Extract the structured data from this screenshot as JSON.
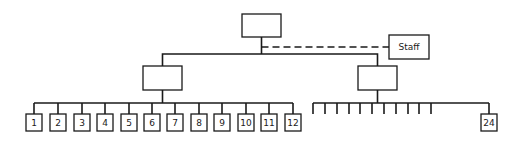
{
  "diagram": {
    "type": "org-chart",
    "top_node": {
      "label": "",
      "box": [
        242,
        14,
        39,
        23
      ]
    },
    "staff_node": {
      "label": "Staff",
      "box": [
        389,
        35,
        40,
        24
      ],
      "link": "dashed"
    },
    "mid_nodes": [
      {
        "label": "",
        "box": [
          143,
          66,
          39,
          24
        ]
      },
      {
        "label": "",
        "box": [
          358,
          66,
          39,
          24
        ]
      }
    ],
    "left_children": {
      "bar_y": 103,
      "box_y": 114,
      "box_w": 16,
      "box_h": 17,
      "items": [
        {
          "label": "1",
          "cx": 34
        },
        {
          "label": "2",
          "cx": 58
        },
        {
          "label": "3",
          "cx": 82
        },
        {
          "label": "4",
          "cx": 105
        },
        {
          "label": "5",
          "cx": 129
        },
        {
          "label": "6",
          "cx": 152
        },
        {
          "label": "7",
          "cx": 175
        },
        {
          "label": "8",
          "cx": 199
        },
        {
          "label": "9",
          "cx": 222
        },
        {
          "label": "10",
          "cx": 246
        },
        {
          "label": "11",
          "cx": 269
        },
        {
          "label": "12",
          "cx": 293
        }
      ]
    },
    "right_children": {
      "bar_y": 103,
      "tick_bottom": 114,
      "ticks": [
        313,
        325,
        337,
        349,
        360,
        372,
        384,
        396,
        408,
        419,
        431
      ],
      "last": {
        "label": "24",
        "cx": 489
      }
    },
    "colors": {
      "line": "#1a1a1a",
      "background": "#ffffff"
    }
  }
}
